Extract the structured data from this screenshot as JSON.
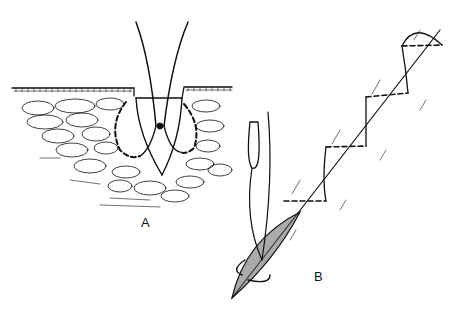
{
  "figure": {
    "panels": [
      {
        "id": "A",
        "label": "A",
        "description": "Cross-section of skin with interrupted suture through wound edges"
      },
      {
        "id": "B",
        "label": "B",
        "description": "Running suture closing diagonal incision with knot tied"
      }
    ],
    "colors": {
      "ink": "#111111",
      "background": "#ffffff"
    }
  }
}
